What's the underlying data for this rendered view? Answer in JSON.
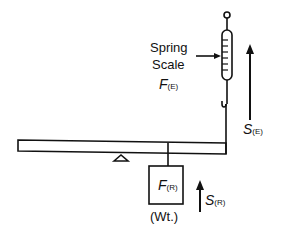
{
  "diagram": {
    "labels": {
      "spring_scale_line1": "Spring",
      "spring_scale_line2": "Scale",
      "effort_force_symbol": "F",
      "effort_force_sub": "(E)",
      "effort_distance_symbol": "S",
      "effort_distance_sub": "(E)",
      "resistance_force_symbol": "F",
      "resistance_force_sub": "(R)",
      "resistance_distance_symbol": "S",
      "resistance_distance_sub": "(R)",
      "weight_label": "(Wt.)"
    },
    "colors": {
      "line": "#111111",
      "background": "#ffffff"
    }
  }
}
